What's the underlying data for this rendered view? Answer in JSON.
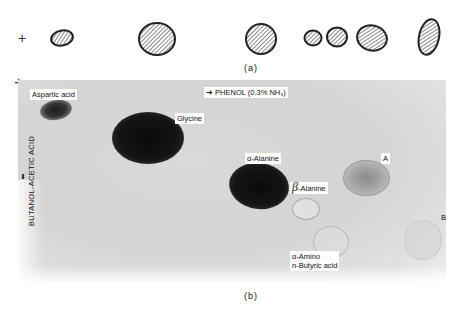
{
  "panel_a": {
    "origin_marker": "+",
    "spots": [
      {
        "x": 52,
        "y": 31,
        "w": 22,
        "h": 15,
        "rot": -10
      },
      {
        "x": 139,
        "y": 23,
        "w": 37,
        "h": 33,
        "rot": 0
      },
      {
        "x": 246,
        "y": 23,
        "w": 31,
        "h": 31,
        "rot": 0
      },
      {
        "x": 305,
        "y": 31,
        "w": 17,
        "h": 15,
        "rot": 0
      },
      {
        "x": 327,
        "y": 28,
        "w": 20,
        "h": 19,
        "rot": 0
      },
      {
        "x": 357,
        "y": 25,
        "w": 30,
        "h": 26,
        "rot": 10
      },
      {
        "x": 418,
        "y": 19,
        "w": 21,
        "h": 36,
        "rot": 10
      }
    ],
    "caption": "(a)"
  },
  "panel_b": {
    "origin_marker": "+",
    "solvent_horizontal": "➜ PHENOL (0.3% NH₃)",
    "solvent_vertical": "BUTANOL-ACETIC ACID",
    "arrow_down": "⬇",
    "labels": {
      "aspartic_acid": "Aspartic acid",
      "glycine": "Glycine",
      "alpha_alanine": "α-Alanine",
      "beta_alanine_greek": "β",
      "beta_alanine_text": "-Alanine",
      "spot_a": "A",
      "spot_b": "B",
      "aminobutyric_line1": "α-Amino",
      "aminobutyric_line2": "n-Butyric acid"
    },
    "caption": "(b)"
  }
}
